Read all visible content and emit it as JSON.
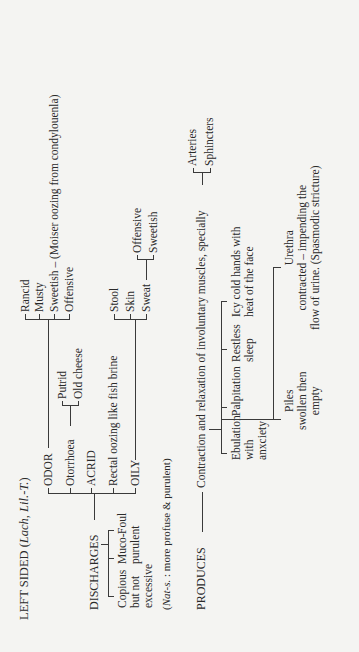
{
  "title": {
    "text": "LEFT SIDED (",
    "remedies": "Lach, Lil.-T.",
    "close": ")"
  },
  "discharges": {
    "label": "DISCHARGES",
    "qualities": [
      {
        "label_lines": [
          "Copious",
          "but not",
          "excessive"
        ]
      },
      {
        "label_lines": [
          "Muco-",
          "purulent"
        ]
      },
      {
        "label_lines": [
          "Foul"
        ]
      }
    ],
    "note_remedy": "Nat-s.",
    "note_text": " : more profuse & purulent)",
    "note_open": "(",
    "types": {
      "odor": {
        "label": "ODOR",
        "items": [
          "Rancid",
          "Musty",
          "Sweetish – (Moiser oozing from condylouenla)",
          "Offensive"
        ]
      },
      "otorrhoea": {
        "label": "Otorrhoea",
        "items": [
          "Putrid",
          "Old cheese"
        ]
      },
      "acrid": {
        "label": "ACRID"
      },
      "rectal": {
        "label": "Rectal oozing like fish brine"
      },
      "oily": {
        "label": "OILY",
        "items": [
          "Stool",
          "Skin",
          "Sweat"
        ],
        "sweat_items": [
          "Offensive",
          "Sweetish"
        ]
      }
    }
  },
  "produces": {
    "label": "PRODUCES",
    "main": "Contraction and relaxation of involuntary muscles, specially",
    "specially_items": [
      "Arteries",
      "Sphincters"
    ],
    "effects": [
      {
        "label_lines": [
          "Ebulation",
          "with",
          "anxciety"
        ]
      },
      {
        "label_lines": [
          "Palpitation"
        ]
      },
      {
        "label_lines": [
          "Restless",
          "sleep"
        ]
      },
      {
        "label_lines": [
          "Icy cold hands with",
          "heat of the face"
        ]
      }
    ],
    "sub_effects": [
      {
        "label_lines": [
          "Piles",
          "swollen then",
          "empty"
        ]
      },
      {
        "label_lines": [
          "Urethra",
          "contracted – impending the",
          "flow of urine. (Spasmodic stricture)"
        ]
      }
    ]
  }
}
